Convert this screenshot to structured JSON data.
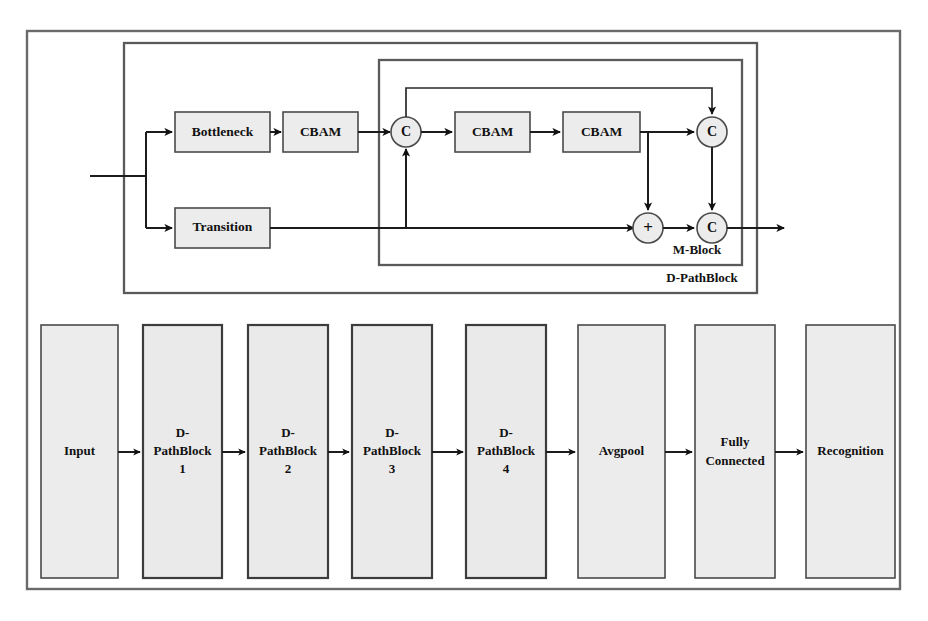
{
  "figure": {
    "name": "network-architecture-diagram",
    "colors": {
      "box_fill": "#ececec",
      "box_stroke": "#4a4a4a",
      "frame_stroke": "#5a5a5a",
      "wire": "#1c1c1c",
      "background": "#ffffff"
    }
  },
  "dpathblock": {
    "group_label": "D-PathBlock",
    "mblock_label": "M-Block",
    "branches": {
      "top": [
        {
          "id": "bottleneck",
          "label": "Bottleneck"
        },
        {
          "id": "cbam1",
          "label": "CBAM"
        }
      ],
      "bottom": [
        {
          "id": "transition",
          "label": "Transition"
        }
      ]
    },
    "mblock_nodes": [
      {
        "id": "concat-in",
        "label": "C",
        "kind": "concat"
      },
      {
        "id": "cbam2",
        "label": "CBAM",
        "kind": "box"
      },
      {
        "id": "cbam3",
        "label": "CBAM",
        "kind": "box"
      },
      {
        "id": "concat-top",
        "label": "C",
        "kind": "concat"
      },
      {
        "id": "add",
        "label": "+",
        "kind": "add"
      },
      {
        "id": "concat-out",
        "label": "C",
        "kind": "concat"
      }
    ]
  },
  "pipeline": {
    "stages": [
      {
        "id": "input",
        "lines": [
          "Input"
        ],
        "emphasis": false
      },
      {
        "id": "d-pathblock-1",
        "lines": [
          "D-",
          "PathBlock",
          "1"
        ],
        "emphasis": true
      },
      {
        "id": "d-pathblock-2",
        "lines": [
          "D-",
          "PathBlock",
          "2"
        ],
        "emphasis": true
      },
      {
        "id": "d-pathblock-3",
        "lines": [
          "D-",
          "PathBlock",
          "3"
        ],
        "emphasis": true
      },
      {
        "id": "d-pathblock-4",
        "lines": [
          "D-",
          "PathBlock",
          "4"
        ],
        "emphasis": true
      },
      {
        "id": "avgpool",
        "lines": [
          "Avgpool"
        ],
        "emphasis": false
      },
      {
        "id": "fully-connected",
        "lines": [
          "Fully",
          "Connected"
        ],
        "emphasis": false
      },
      {
        "id": "recognition",
        "lines": [
          "Recognition"
        ],
        "emphasis": false
      }
    ]
  }
}
